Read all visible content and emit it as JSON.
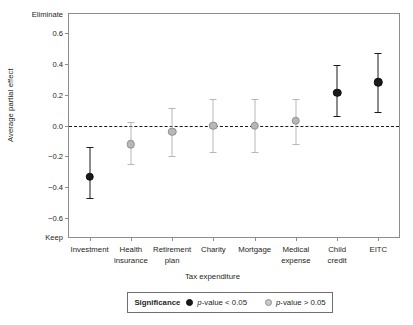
{
  "chart_data": {
    "type": "scatter",
    "title": "",
    "xlabel": "Tax expenditure",
    "ylabel": "Average partial effect",
    "ylim": [
      -0.72,
      0.72
    ],
    "yticks": [
      0.6,
      0.4,
      0.2,
      0.0,
      -0.2,
      -0.4,
      -0.6
    ],
    "ytick_labels": [
      "0.6",
      "0.4",
      "0.2",
      "0.0",
      "-0.2",
      "-0.4",
      "-0.6"
    ],
    "y_axis_end_labels": {
      "top": "Eliminate",
      "bottom": "Keep"
    },
    "grid": false,
    "zero_reference_line": true,
    "legend_position": "bottom",
    "legend_title": "Significance",
    "categories": [
      "Investment",
      "Health insurance",
      "Retirement plan",
      "Charity",
      "Mortgage",
      "Medical expense",
      "Child credit",
      "EITC"
    ],
    "category_label_lines": [
      [
        "Investment"
      ],
      [
        "Health",
        "insurance"
      ],
      [
        "Retirement",
        "plan"
      ],
      [
        "Charity"
      ],
      [
        "Mortgage"
      ],
      [
        "Medical",
        "expense"
      ],
      [
        "Child",
        "credit"
      ],
      [
        "EITC"
      ]
    ],
    "values": [
      -0.33,
      -0.12,
      -0.04,
      0.0,
      0.0,
      0.03,
      0.21,
      0.28
    ],
    "ci_low": [
      -0.47,
      -0.25,
      -0.2,
      -0.17,
      -0.17,
      -0.12,
      0.06,
      0.09
    ],
    "ci_high": [
      -0.14,
      0.02,
      0.11,
      0.17,
      0.17,
      0.17,
      0.39,
      0.47
    ],
    "significance": [
      "p-value < 0.05",
      "p-value > 0.05",
      "p-value > 0.05",
      "p-value > 0.05",
      "p-value > 0.05",
      "p-value > 0.05",
      "p-value < 0.05",
      "p-value < 0.05"
    ],
    "colors": {
      "significant": "#1a1a1a",
      "not_significant": "#b7b7b7",
      "axis": "#8c8c8c",
      "text": "#231f20"
    }
  },
  "legend": {
    "title": "Significance",
    "entries": [
      {
        "key": "significant-marker",
        "label_prefix": "p",
        "label_suffix": "-value < 0.05"
      },
      {
        "key": "not-significant-marker",
        "label_prefix": "p",
        "label_suffix": "-value > 0.05"
      }
    ]
  }
}
